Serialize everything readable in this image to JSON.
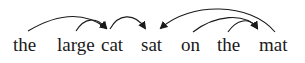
{
  "diagram": {
    "type": "dependency-parse",
    "sentence": "the large cat sat on the mat",
    "words": [
      {
        "text": "the",
        "x": 13
      },
      {
        "text": "large",
        "x": 58
      },
      {
        "text": "cat",
        "x": 102
      },
      {
        "text": "sat",
        "x": 142
      },
      {
        "text": "on",
        "x": 181
      },
      {
        "text": "the",
        "x": 217
      },
      {
        "text": "mat",
        "x": 260
      }
    ],
    "arcs": [
      {
        "from": "the",
        "to": "cat",
        "from_index": 0,
        "to_index": 2
      },
      {
        "from": "large",
        "to": "cat",
        "from_index": 1,
        "to_index": 2
      },
      {
        "from": "cat",
        "to": "sat",
        "from_index": 2,
        "to_index": 3
      },
      {
        "from": "mat",
        "to": "sat",
        "from_index": 6,
        "to_index": 3
      },
      {
        "from": "on",
        "to": "mat",
        "from_index": 4,
        "to_index": 6
      },
      {
        "from": "the",
        "to": "mat",
        "from_index": 5,
        "to_index": 6
      }
    ],
    "colors": {
      "line": "#1a1a1a",
      "text": "#1a1a1a",
      "background": "#ffffff"
    }
  }
}
